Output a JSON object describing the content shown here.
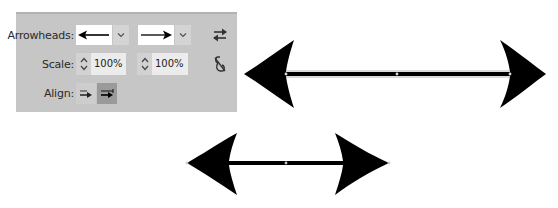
{
  "panel": {
    "arrowheads_label": "Arrowheads:",
    "start_arrowhead": {
      "icon": "arrow-left-icon",
      "selected": "left arrow"
    },
    "end_arrowhead": {
      "icon": "arrow-right-icon",
      "selected": "right arrow"
    },
    "swap_icon": "swap-arrows-icon",
    "scale_label": "Scale:",
    "start_scale": "100%",
    "end_scale": "100%",
    "link_icon": "unlink-icon",
    "align_label": "Align:",
    "align_options": [
      {
        "name": "extend-arrow-beyond-path",
        "active": false
      },
      {
        "name": "place-arrow-at-path-end",
        "active": true
      }
    ]
  },
  "colors": {
    "panel_bg": "#c6c6c6",
    "input_bg": "#ececec",
    "active_btn": "#9a9a9a",
    "arrow_fill": "#000000"
  }
}
